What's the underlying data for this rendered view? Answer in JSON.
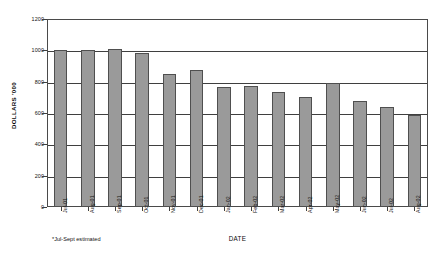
{
  "chart_data": {
    "type": "bar",
    "title": "",
    "xlabel": "DATE",
    "ylabel": "DOLLARS '000",
    "categories": [
      "Jul-01",
      "Aug-01",
      "Sep-01",
      "Oct-01",
      "Nov-01",
      "Dec-01",
      "Jan-02",
      "Feb-02",
      "Mar-02",
      "Apr-02",
      "May-02",
      "Jun-02",
      "Jul-02",
      "Aug-02"
    ],
    "values": [
      1005,
      1005,
      1008,
      985,
      850,
      875,
      765,
      770,
      735,
      705,
      790,
      675,
      640,
      590
    ],
    "ylim": [
      0,
      1200
    ],
    "ytick_values": [
      0,
      200,
      400,
      600,
      800,
      1000,
      1200
    ],
    "ytick_labels": [
      "0",
      "200",
      "400",
      "600",
      "800",
      "1000",
      "1200"
    ],
    "grid": true,
    "legend": false,
    "bar_color": "#9a9a9a",
    "bar_edge_color": "#4f4f4f",
    "axis_color": "#3f3f3f",
    "annotations": [
      "*Jul-Sept estimated"
    ]
  },
  "footnote": "*Jul-Sept estimated"
}
